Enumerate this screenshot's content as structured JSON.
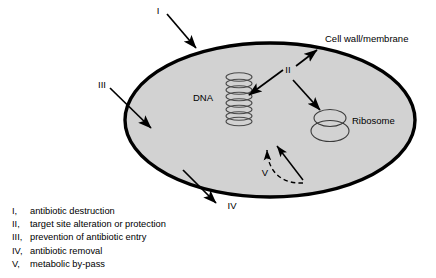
{
  "figure": {
    "title_alt": "Mechanisms of antibiotic resistance in a bacterial cell",
    "colors": {
      "cytoplasm_fill": "#d2d2d2",
      "membrane_stroke": "#000000",
      "organelle_stroke": "#3a3a3a",
      "text": "#000000",
      "background": "#ffffff"
    }
  },
  "cell": {
    "labels": {
      "cell_wall": "Cell wall/membrane",
      "dna": "DNA",
      "ribosome": "Ribosome"
    }
  },
  "markers": {
    "one": "I",
    "two": "II",
    "three": "III",
    "four": "IV",
    "five": "V"
  },
  "legend": {
    "items": [
      {
        "num": "I,",
        "text": "antibiotic destruction"
      },
      {
        "num": "II,",
        "text": "target site alteration or protection"
      },
      {
        "num": "III,",
        "text": "prevention of antibiotic entry"
      },
      {
        "num": "IV,",
        "text": "antibiotic removal"
      },
      {
        "num": "V,",
        "text": "metabolic by-pass"
      }
    ]
  }
}
